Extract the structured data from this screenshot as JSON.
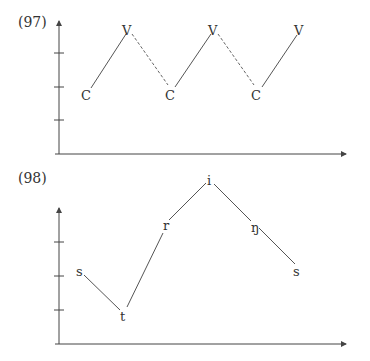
{
  "figures": [
    {
      "label": "(97)",
      "description": "CV syllable sonority contour",
      "axis": {
        "y_ticks": 3,
        "style": "arrowed axes"
      },
      "points": [
        {
          "label": "C",
          "level": 1
        },
        {
          "label": "V",
          "level": 3
        },
        {
          "label": "C",
          "level": 1
        },
        {
          "label": "V",
          "level": 3
        },
        {
          "label": "C",
          "level": 1
        },
        {
          "label": "V",
          "level": 3
        }
      ],
      "segments": [
        {
          "from": 0,
          "to": 1,
          "style": "solid"
        },
        {
          "from": 1,
          "to": 2,
          "style": "dashed"
        },
        {
          "from": 2,
          "to": 3,
          "style": "solid"
        },
        {
          "from": 3,
          "to": 4,
          "style": "dashed"
        },
        {
          "from": 4,
          "to": 5,
          "style": "solid"
        }
      ]
    },
    {
      "label": "(98)",
      "description": "Sonority contour of 'string-s'",
      "axis": {
        "y_ticks": 3,
        "style": "arrowed axes"
      },
      "points": [
        {
          "label": "s",
          "level": 1.6
        },
        {
          "label": "t",
          "level": 0.5
        },
        {
          "label": "r",
          "level": 3.0
        },
        {
          "label": "i",
          "level": 4.2
        },
        {
          "label": "ŋ",
          "level": 3.0
        },
        {
          "label": "s",
          "level": 1.8
        }
      ],
      "segments": [
        {
          "from": 0,
          "to": 1,
          "style": "solid"
        },
        {
          "from": 1,
          "to": 2,
          "style": "solid"
        },
        {
          "from": 2,
          "to": 3,
          "style": "solid"
        },
        {
          "from": 3,
          "to": 4,
          "style": "solid"
        },
        {
          "from": 4,
          "to": 5,
          "style": "solid"
        }
      ]
    }
  ],
  "colors": {
    "line": "#444444",
    "text": "#333333",
    "background": "#ffffff"
  }
}
